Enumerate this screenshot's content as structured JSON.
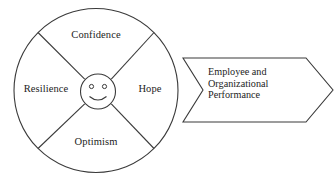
{
  "diagram": {
    "background_color": "#ffffff",
    "line_color": "#3a3a3a",
    "text_color": "#1c1c1c",
    "wheel": {
      "center_icon": "smiley-face-icon",
      "segments": [
        {
          "id": "confidence",
          "label": "Confidence",
          "position": "top"
        },
        {
          "id": "hope",
          "label": "Hope",
          "position": "right"
        },
        {
          "id": "optimism",
          "label": "Optimism",
          "position": "bottom"
        },
        {
          "id": "resilience",
          "label": "Resilience",
          "position": "left"
        }
      ]
    },
    "arrow": {
      "shape": "chevron-arrow-right",
      "lines": [
        "Employee and",
        "Organizational",
        "Performance"
      ]
    }
  }
}
